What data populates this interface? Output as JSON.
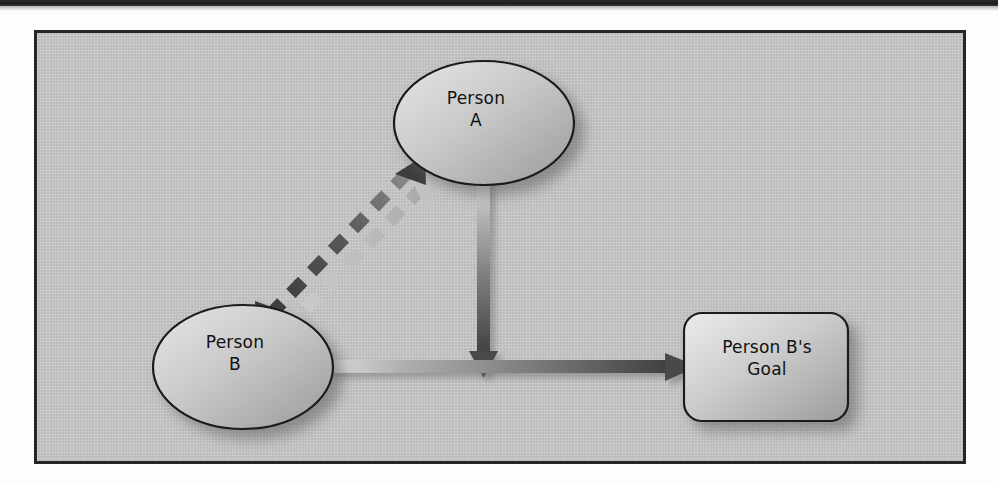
{
  "page": {
    "background_color": "#fdfdfd",
    "scan_bar_color": "#1d1d1d"
  },
  "figure": {
    "frame_border_color": "#262626",
    "canvas_color": "#cdcdcd",
    "title": ""
  },
  "diagram": {
    "type": "node-link",
    "nodes": [
      {
        "id": "person-a",
        "label": "Person\nA",
        "shape": "ellipse",
        "cx": 447,
        "cy": 90,
        "rx": 90,
        "ry": 62,
        "fill_light": "#e2e2e2",
        "fill_dark": "#9c9c9c",
        "stroke": "#1a1a1a"
      },
      {
        "id": "person-b",
        "label": "Person\nB",
        "shape": "ellipse",
        "cx": 206,
        "cy": 334,
        "rx": 90,
        "ry": 62,
        "fill_light": "#e2e2e2",
        "fill_dark": "#9c9c9c",
        "stroke": "#1a1a1a"
      },
      {
        "id": "person-b-goal",
        "label": "Person B's\nGoal",
        "shape": "rounded-rectangle",
        "x": 647,
        "y": 280,
        "width": 164,
        "height": 108,
        "corner_radius": 18,
        "fill_light": "#e4e4e4",
        "fill_dark": "#9e9e9e",
        "stroke": "#1a1a1a"
      }
    ],
    "edges": [
      {
        "id": "edge-a-b-bidirectional",
        "from": "person-a",
        "to": "person-b",
        "style": "dashed",
        "arrowheads": "both",
        "color_dark": "#555555",
        "color_light": "#b4b4b4",
        "label": ""
      },
      {
        "id": "edge-a-to-goal-path",
        "from": "person-a",
        "to": "goal-line",
        "style": "solid",
        "arrowheads": "end",
        "direction": "down",
        "color_start": "#d6d6d6",
        "color_end": "#4a4a4a",
        "label": ""
      },
      {
        "id": "edge-b-to-goal",
        "from": "person-b",
        "to": "person-b-goal",
        "style": "solid",
        "arrowheads": "end",
        "direction": "right",
        "color_start": "#d8d8d8",
        "color_end": "#4a4a4a",
        "label": ""
      }
    ]
  }
}
